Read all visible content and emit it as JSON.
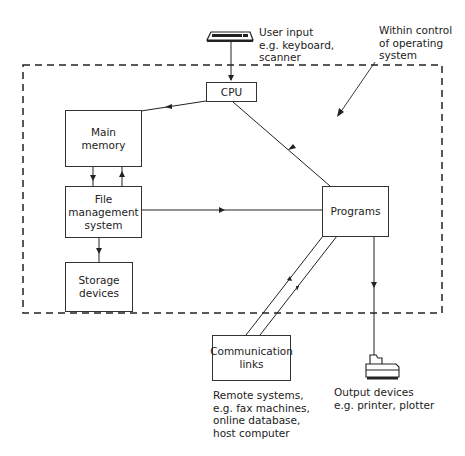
{
  "diagram": {
    "boundary_label": "Within control\nof operating\nsystem",
    "nodes": {
      "cpu": "CPU",
      "main_memory": "Main\nmemory",
      "file_management": "File\nmanagement\nsystem",
      "storage": "Storage\ndevices",
      "programs": "Programs",
      "communication": "Communication\nlinks"
    },
    "annotations": {
      "user_input": "User input\ne.g. keyboard,\nscanner",
      "remote_systems": "Remote systems,\ne.g. fax machines,\nonline database,\nhost computer",
      "output_devices": "Output devices\ne.g. printer, plotter"
    },
    "icons": {
      "keyboard": "keyboard-icon",
      "printer": "printer-icon"
    },
    "edges": [
      {
        "from": "keyboard",
        "to": "cpu"
      },
      {
        "from": "cpu",
        "to": "main_memory"
      },
      {
        "from": "programs",
        "to": "cpu"
      },
      {
        "from": "main_memory",
        "to": "file_management"
      },
      {
        "from": "file_management",
        "to": "main_memory"
      },
      {
        "from": "file_management",
        "to": "programs"
      },
      {
        "from": "file_management",
        "to": "storage"
      },
      {
        "from": "communication",
        "to": "programs"
      },
      {
        "from": "programs",
        "to": "communication"
      },
      {
        "from": "programs",
        "to": "printer"
      }
    ]
  }
}
